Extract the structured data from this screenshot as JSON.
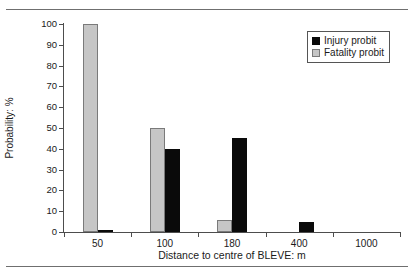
{
  "figure": {
    "caption_sliver": "",
    "rules": [
      "top",
      "bottom"
    ]
  },
  "chart_data": {
    "type": "bar",
    "title": "",
    "xlabel": "Distance to centre of BLEVE: m",
    "ylabel": "Probability: %",
    "categories": [
      "50",
      "100",
      "180",
      "400",
      "1000"
    ],
    "ylim": [
      0,
      100
    ],
    "ytick_values": [
      0,
      10,
      20,
      30,
      40,
      50,
      60,
      70,
      80,
      90,
      100
    ],
    "ytick_labels": [
      "0",
      "10",
      "20",
      "30",
      "40",
      "50",
      "60",
      "70",
      "80",
      "90",
      "100"
    ],
    "grid": false,
    "legend_position": "top-right",
    "series": [
      {
        "name": "Injury probit",
        "color": "#0a0a0a",
        "values": [
          1,
          40,
          45,
          5,
          0
        ]
      },
      {
        "name": "Fatality probit",
        "color": "#c6c6c6",
        "values": [
          100,
          50,
          6,
          0,
          0
        ]
      }
    ]
  },
  "legend": {
    "items": [
      {
        "label": "Injury probit",
        "swatch": "black-square-icon"
      },
      {
        "label": "Fatality probit",
        "swatch": "gray-square-icon"
      }
    ]
  }
}
